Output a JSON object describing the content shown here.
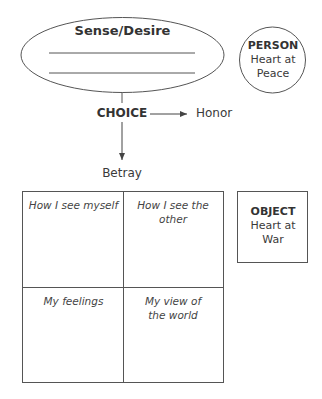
{
  "ellipse": {
    "title": "Sense/Desire",
    "blank_lines": 2
  },
  "person": {
    "heading": "PERSON",
    "line1": "Heart at",
    "line2": "Peace"
  },
  "choice": {
    "label": "CHOICE",
    "right_outcome": "Honor",
    "down_outcome": "Betray"
  },
  "grid": {
    "cells": [
      {
        "text": "How I see myself"
      },
      {
        "text": "How I see the other"
      },
      {
        "text": "My feelings"
      },
      {
        "text": "My view of the world"
      }
    ]
  },
  "object": {
    "heading": "OBJECT",
    "line1": "Heart at",
    "line2": "War"
  },
  "colors": {
    "stroke": "#555555",
    "text": "#333333",
    "background": "#ffffff"
  }
}
